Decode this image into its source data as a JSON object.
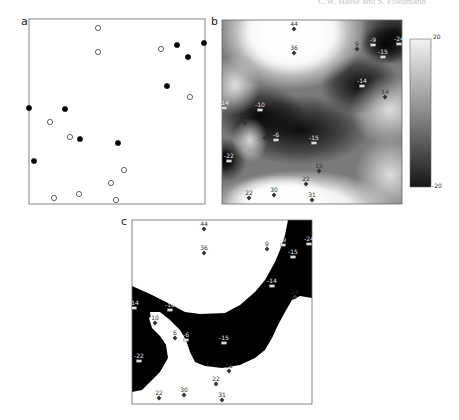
{
  "running_head": "C.W. Hasse and S. Friedmann",
  "panels": {
    "a": {
      "letter": "a",
      "box": {
        "x": 29,
        "y": 19,
        "w": 176,
        "h": 185
      },
      "points": [
        {
          "x": 98,
          "y": 28,
          "type": "open"
        },
        {
          "x": 98,
          "y": 52,
          "type": "open"
        },
        {
          "x": 161,
          "y": 49,
          "type": "open"
        },
        {
          "x": 177,
          "y": 45,
          "type": "filled"
        },
        {
          "x": 204,
          "y": 43,
          "type": "filled"
        },
        {
          "x": 188,
          "y": 57,
          "type": "filled"
        },
        {
          "x": 167,
          "y": 86,
          "type": "filled"
        },
        {
          "x": 190,
          "y": 97,
          "type": "open"
        },
        {
          "x": 29,
          "y": 108,
          "type": "filled"
        },
        {
          "x": 65,
          "y": 109,
          "type": "filled"
        },
        {
          "x": 50,
          "y": 122,
          "type": "open"
        },
        {
          "x": 70,
          "y": 137,
          "type": "open"
        },
        {
          "x": 80,
          "y": 139,
          "type": "filled"
        },
        {
          "x": 118,
          "y": 143,
          "type": "filled"
        },
        {
          "x": 34,
          "y": 161,
          "type": "filled"
        },
        {
          "x": 124,
          "y": 170,
          "type": "open"
        },
        {
          "x": 111,
          "y": 183,
          "type": "open"
        },
        {
          "x": 54,
          "y": 198,
          "type": "open"
        },
        {
          "x": 79,
          "y": 194,
          "type": "open"
        },
        {
          "x": 116,
          "y": 200,
          "type": "open"
        }
      ]
    },
    "b": {
      "letter": "b",
      "box": {
        "x": 222,
        "y": 20,
        "w": 180,
        "h": 184
      }
    },
    "c": {
      "letter": "c",
      "box": {
        "x": 132,
        "y": 220,
        "w": 180,
        "h": 184
      }
    }
  },
  "samples": [
    {
      "label": "44",
      "rx": 72,
      "ry": 9,
      "marker": "diamond"
    },
    {
      "label": "36",
      "rx": 72,
      "ry": 33,
      "marker": "diamond"
    },
    {
      "label": "9",
      "rx": 135,
      "ry": 29,
      "marker": "diamond"
    },
    {
      "label": "-9",
      "rx": 151,
      "ry": 25,
      "marker": "square"
    },
    {
      "label": "-24",
      "rx": 177,
      "ry": 24,
      "marker": "square"
    },
    {
      "label": "-15",
      "rx": 161,
      "ry": 37,
      "marker": "square"
    },
    {
      "label": "-14",
      "rx": 140,
      "ry": 66,
      "marker": "square"
    },
    {
      "label": "14",
      "rx": 163,
      "ry": 77,
      "marker": "diamond"
    },
    {
      "label": "-14",
      "rx": 2,
      "ry": 88,
      "marker": "square"
    },
    {
      "label": "-10",
      "rx": 38,
      "ry": 90,
      "marker": "square"
    },
    {
      "label": "10",
      "rx": 23,
      "ry": 103,
      "marker": "diamond"
    },
    {
      "label": "6",
      "rx": 43,
      "ry": 118,
      "marker": "diamond"
    },
    {
      "label": "-6",
      "rx": 54,
      "ry": 120,
      "marker": "square"
    },
    {
      "label": "-15",
      "rx": 92,
      "ry": 123,
      "marker": "square"
    },
    {
      "label": "-22",
      "rx": 7,
      "ry": 141,
      "marker": "square"
    },
    {
      "label": "15",
      "rx": 97,
      "ry": 151,
      "marker": "diamond"
    },
    {
      "label": "22",
      "rx": 84,
      "ry": 164,
      "marker": "diamond"
    },
    {
      "label": "22",
      "rx": 27,
      "ry": 178,
      "marker": "diamond"
    },
    {
      "label": "30",
      "rx": 52,
      "ry": 175,
      "marker": "diamond"
    },
    {
      "label": "31",
      "rx": 90,
      "ry": 180,
      "marker": "diamond"
    }
  ],
  "colorbar": {
    "box": {
      "x": 410,
      "y": 39,
      "w": 21,
      "h": 148
    },
    "max_label": "20",
    "min_label": "-20",
    "top_color": "#f2f2f2",
    "bottom_color": "#151515"
  },
  "colors": {
    "frame": "#555555",
    "marker": "#333333",
    "square_marker_fill": "#dddddd",
    "label_on_dark": "#e6e6e6",
    "label_on_light": "#333333",
    "black_region": "#000000"
  }
}
